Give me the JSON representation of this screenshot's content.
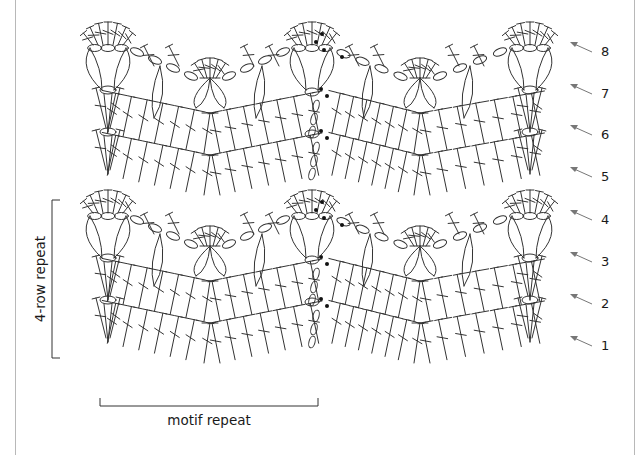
{
  "diagram": {
    "type": "crochet-stitch-chart",
    "pattern": "chevron with shell peaks",
    "ink_color": "#333333",
    "arrow_color": "#777777",
    "frame_color": "#b8b8b8",
    "rows": [
      {
        "number": "1",
        "kind": "chevron-treble"
      },
      {
        "number": "2",
        "kind": "chevron-treble"
      },
      {
        "number": "3",
        "kind": "leaf-clusters"
      },
      {
        "number": "4",
        "kind": "shell-peaks"
      },
      {
        "number": "5",
        "kind": "chevron-treble"
      },
      {
        "number": "6",
        "kind": "chevron-treble"
      },
      {
        "number": "7",
        "kind": "leaf-clusters"
      },
      {
        "number": "8",
        "kind": "shell-peaks"
      }
    ],
    "row_repeat_label": "4-row repeat",
    "motif_repeat_label": "motif repeat",
    "start_marker": "filled-dot"
  }
}
